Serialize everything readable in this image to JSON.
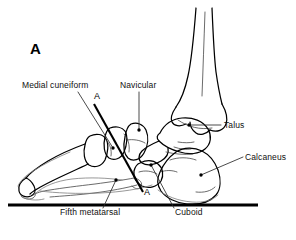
{
  "figure": {
    "panel_letter": "A",
    "background_color": "#ffffff",
    "ink_color": "#000000",
    "caption_font_size_px": 8.5
  },
  "labels": [
    {
      "id": "medial-cuneiform",
      "text": "Medial cuneiform",
      "text_x": 22,
      "text_y": 88,
      "anchor": "start",
      "leader": {
        "x1": 78,
        "y1": 92,
        "x2": 113,
        "y2": 148
      },
      "dot": {
        "cx": 113,
        "cy": 148
      }
    },
    {
      "id": "navicular",
      "text": "Navicular",
      "text_x": 120,
      "text_y": 88,
      "anchor": "start",
      "leader": {
        "x1": 139,
        "y1": 92,
        "x2": 139,
        "y2": 130
      },
      "dot": {
        "cx": 139,
        "cy": 130
      }
    },
    {
      "id": "talus",
      "text": "Talus",
      "text_x": 224,
      "text_y": 128,
      "anchor": "start",
      "leader": {
        "x1": 221,
        "y1": 125,
        "x2": 189,
        "y2": 125
      },
      "dot": {
        "cx": 189,
        "cy": 125
      }
    },
    {
      "id": "calcaneus",
      "text": "Calcaneus",
      "text_x": 245,
      "text_y": 160,
      "anchor": "start",
      "leader": {
        "x1": 243,
        "y1": 157,
        "x2": 201,
        "y2": 175
      },
      "dot": {
        "cx": 201,
        "cy": 175
      }
    },
    {
      "id": "fifth-metatarsal",
      "text": "Fifth metatarsal",
      "text_x": 60,
      "text_y": 215,
      "anchor": "start",
      "leader": {
        "x1": 103,
        "y1": 208,
        "x2": 116,
        "y2": 180
      },
      "dot": {
        "cx": 116,
        "cy": 180
      }
    },
    {
      "id": "cuboid",
      "text": "Cuboid",
      "text_x": 175,
      "text_y": 215,
      "anchor": "start",
      "leader": {
        "x1": 174,
        "y1": 208,
        "x2": 151,
        "y2": 165
      },
      "dot": {
        "cx": 151,
        "cy": 165
      }
    }
  ],
  "cut_markers": [
    {
      "id": "cut-marker-top",
      "text": "A",
      "x": 97,
      "y": 99
    },
    {
      "id": "cut-marker-bottom",
      "text": "A",
      "x": 147,
      "y": 195
    }
  ],
  "cut_line": {
    "x1": 94,
    "y1": 104,
    "x2": 143,
    "y2": 192
  },
  "ground_line": {
    "x1": 8,
    "y1": 205,
    "x2": 258,
    "y2": 205
  }
}
